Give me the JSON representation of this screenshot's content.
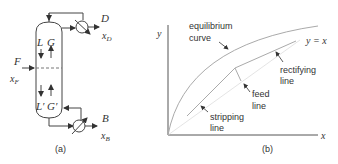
{
  "panel_a": {
    "caption": "(a)",
    "labels": {
      "D": "D",
      "xD_x": "x",
      "xD_sub": "D",
      "F": "F",
      "xF_x": "x",
      "xF_sub": "F",
      "B": "B",
      "xB_x": "x",
      "xB_sub": "B",
      "L": "L",
      "G": "G",
      "Lp": "L′",
      "Gp": "G′"
    }
  },
  "panel_b": {
    "caption": "(b)",
    "axis_x": "x",
    "axis_y": "y",
    "diag_label": "y = x",
    "equilibrium_1": "equilibrium",
    "equilibrium_2": "curve",
    "rectifying_1": "rectifying",
    "rectifying_2": "line",
    "feed_1": "feed",
    "feed_2": "line",
    "stripping_1": "stripping",
    "stripping_2": "line"
  }
}
